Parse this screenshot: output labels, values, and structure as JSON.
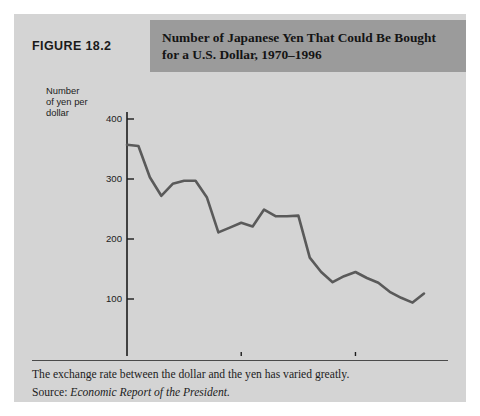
{
  "figure": {
    "label": "FIGURE 18.2",
    "title": "Number of Japanese Yen That Could Be Bought for a U.S. Dollar, 1970–1996",
    "caption": "The exchange rate between the dollar and the yen has varied greatly.",
    "source_label": "Source:",
    "source_text": "Economic Report of the President."
  },
  "colors": {
    "panel_background": "#d4d4d4",
    "title_band": "#9b9b9b",
    "label_band": "#d4d4d4",
    "line": "#5a5a5a",
    "axis": "#1c1c1c",
    "text": "#1c1c1c"
  },
  "chart_data": {
    "type": "line",
    "title": "Number of Japanese Yen That Could Be Bought for a U.S. Dollar, 1970–1996",
    "xlabel": "",
    "ylabel": "Number of yen per dollar",
    "ylabel_lines": [
      "Number",
      "of yen per",
      "dollar"
    ],
    "xlim": [
      1970,
      1996
    ],
    "ylim": [
      0,
      400
    ],
    "yticks": [
      0,
      100,
      200,
      300,
      400
    ],
    "ytick_labels": [
      "0",
      "100",
      "200",
      "300",
      "400"
    ],
    "xticks": [
      1970,
      1980,
      1990
    ],
    "xtick_labels": [
      "1970",
      "1980",
      "1990"
    ],
    "grid": false,
    "legend": false,
    "series": [
      {
        "name": "Yen per U.S. dollar",
        "x": [
          1970,
          1971,
          1972,
          1973,
          1974,
          1975,
          1976,
          1977,
          1978,
          1979,
          1980,
          1981,
          1982,
          1983,
          1984,
          1985,
          1986,
          1987,
          1988,
          1989,
          1990,
          1991,
          1992,
          1993,
          1994,
          1995,
          1996
        ],
        "values": [
          357,
          355,
          303,
          272,
          292,
          297,
          297,
          269,
          211,
          219,
          227,
          221,
          249,
          238,
          238,
          239,
          169,
          145,
          128,
          138,
          145,
          135,
          127,
          112,
          102,
          94,
          109
        ]
      }
    ]
  }
}
